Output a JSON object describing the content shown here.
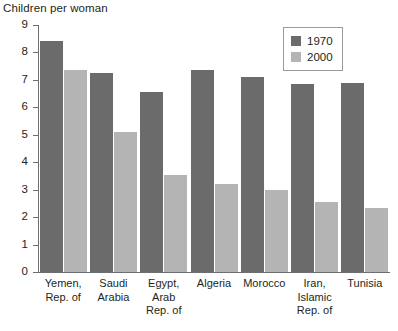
{
  "chart_data": {
    "type": "bar",
    "title": "Children per woman",
    "xlabel": "",
    "ylabel": "",
    "ylim": [
      0,
      9
    ],
    "yticks": [
      0,
      1,
      2,
      3,
      4,
      5,
      6,
      7,
      8,
      9
    ],
    "grid": false,
    "legend_position": "top-right",
    "categories": [
      "Yemen, Rep. of",
      "Saudi Arabia",
      "Egypt, Arab Rep. of",
      "Algeria",
      "Morocco",
      "Iran, Islamic Rep. of",
      "Tunisia"
    ],
    "category_lines": [
      [
        "Yemen,",
        "Rep. of"
      ],
      [
        "Saudi",
        "Arabia"
      ],
      [
        "Egypt,",
        "Arab",
        "Rep. of"
      ],
      [
        "Algeria"
      ],
      [
        "Morocco"
      ],
      [
        "Iran,",
        "Islamic",
        "Rep. of"
      ],
      [
        "Tunisia"
      ]
    ],
    "series": [
      {
        "name": "1970",
        "color": "#6b6b6b",
        "values": [
          8.4,
          7.25,
          6.55,
          7.35,
          7.1,
          6.85,
          6.9
        ]
      },
      {
        "name": "2000",
        "color": "#b4b4b4",
        "values": [
          7.35,
          5.1,
          3.55,
          3.2,
          3.0,
          2.55,
          2.35
        ]
      }
    ]
  },
  "axis": {
    "tick_labels": [
      "9",
      "8",
      "7",
      "6",
      "5",
      "4",
      "3",
      "2",
      "1",
      "0"
    ]
  },
  "legend": {
    "items": [
      {
        "label": "1970",
        "color": "#6b6b6b"
      },
      {
        "label": "2000",
        "color": "#b4b4b4"
      }
    ]
  },
  "colors": {
    "series_1970": "#6b6b6b",
    "series_2000": "#b4b4b4",
    "axis": "#6d6e71",
    "text": "#231f20",
    "legend_border": "#9b9b9b",
    "background": "#ffffff"
  }
}
